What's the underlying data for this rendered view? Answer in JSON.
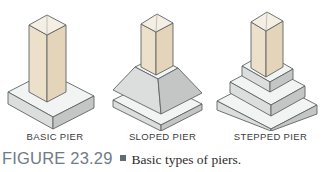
{
  "figure": {
    "number_label": "FIGURE 23.29",
    "bullet": "square-bullet",
    "caption_text": "Basic types of piers."
  },
  "piers": [
    {
      "id": "basic",
      "label": "BASIC PIER",
      "description": "Square column on a single rectangular spread footing"
    },
    {
      "id": "sloped",
      "label": "SLOPED PIER",
      "description": "Square column on a battered (tapered) frustum over a rectangular footing"
    },
    {
      "id": "stepped",
      "label": "STEPPED PIER",
      "description": "Square column on three stacked rectangular footing steps of decreasing size"
    }
  ],
  "colors": {
    "column_left_face": "#ece0cb",
    "column_right_face": "#e4d4ba",
    "column_top_face": "#f5efe3",
    "concrete_top_face": "#f2f3f3",
    "concrete_left_face": "#dcdedd",
    "concrete_right_face": "#c3c6c5",
    "outline": "#5d6465",
    "label_text": "#3b3b3b",
    "caption_figno": "#6f7b86",
    "caption_body": "#2b2b2b",
    "background": "#ffffff"
  }
}
